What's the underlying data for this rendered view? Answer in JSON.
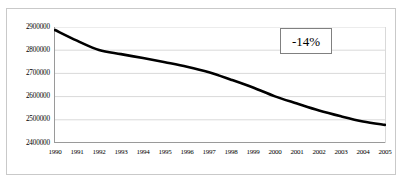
{
  "chart_data": {
    "type": "line",
    "title": "",
    "subtitle": "",
    "xlabel": "",
    "ylabel": "",
    "categories": [
      "1990",
      "1991",
      "1992",
      "1993",
      "1994",
      "1995",
      "1996",
      "1997",
      "1998",
      "1999",
      "2000",
      "2001",
      "2002",
      "2003",
      "2004",
      "2005"
    ],
    "values": [
      2887000,
      2841000,
      2801000,
      2783000,
      2766000,
      2748000,
      2729000,
      2705000,
      2673000,
      2639000,
      2601000,
      2570000,
      2540000,
      2515000,
      2493000,
      2478000
    ],
    "series": [
      {
        "name": "",
        "values": [
          2887000,
          2841000,
          2801000,
          2783000,
          2766000,
          2748000,
          2729000,
          2705000,
          2673000,
          2639000,
          2601000,
          2570000,
          2540000,
          2515000,
          2493000,
          2478000
        ]
      }
    ],
    "ylim": [
      2400000,
      2900000
    ],
    "ytick_labels": [
      "2900000",
      "2800000",
      "2700000",
      "2600000",
      "2500000",
      "2400000"
    ],
    "ytick_values": [
      2900000,
      2800000,
      2700000,
      2600000,
      2500000,
      2400000
    ],
    "xtick_labels": [
      "1990",
      "1991",
      "1992",
      "1993",
      "1994",
      "1995",
      "1996",
      "1997",
      "1998",
      "1999",
      "2000",
      "2001",
      "2002",
      "2003",
      "2004",
      "2005"
    ],
    "grid": "horizontal",
    "legend": "none",
    "annotations": [
      {
        "text": "-14%",
        "position": "upper-right",
        "boxed": true
      }
    ],
    "line_color": "#000000",
    "line_width": 2.6,
    "grid_color": "#d9d9d9",
    "border_color": "#c9c9c9",
    "background_color": "#ffffff"
  }
}
